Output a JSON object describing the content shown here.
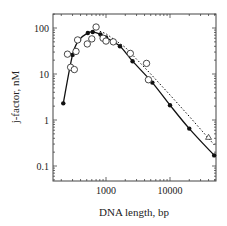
{
  "chart_data": {
    "type": "scatter",
    "title": "",
    "xlabel": "DNA length, bp",
    "ylabel": "j-factor, nM",
    "xscale": "log",
    "yscale": "log",
    "xlim": [
      150,
      55000
    ],
    "ylim": [
      0.05,
      200
    ],
    "x_ticks": [
      {
        "value": 1000,
        "label": "1000"
      },
      {
        "value": 10000,
        "label": "10000"
      }
    ],
    "y_ticks": [
      {
        "value": 100,
        "label": "100"
      },
      {
        "value": 10,
        "label": "10"
      },
      {
        "value": 1,
        "label": "1"
      },
      {
        "value": 0.1,
        "label": "0.1"
      }
    ],
    "grid": false,
    "legend": null,
    "series": [
      {
        "name": "filled circles (solid fit line)",
        "marker": "filled-circle",
        "line": "solid",
        "points": [
          [
            215,
            2.3
          ],
          [
            300,
            26
          ],
          [
            380,
            55
          ],
          [
            520,
            78
          ],
          [
            620,
            82
          ],
          [
            820,
            72
          ],
          [
            1000,
            62
          ],
          [
            1650,
            40
          ],
          [
            2600,
            19
          ],
          [
            5300,
            6.5
          ],
          [
            10000,
            2.1
          ],
          [
            20000,
            0.65
          ],
          [
            49000,
            0.17
          ]
        ]
      },
      {
        "name": "open circles",
        "marker": "open-circle",
        "line": "none",
        "points": [
          [
            250,
            27
          ],
          [
            280,
            14
          ],
          [
            320,
            12.5
          ],
          [
            340,
            31
          ],
          [
            360,
            55
          ],
          [
            510,
            45
          ],
          [
            600,
            58
          ],
          [
            700,
            105
          ],
          [
            900,
            60
          ],
          [
            1000,
            52
          ],
          [
            1300,
            50
          ],
          [
            2400,
            28
          ],
          [
            4300,
            17
          ],
          [
            4600,
            7.5
          ]
        ]
      },
      {
        "name": "dotted theoretical line",
        "marker": "none",
        "line": "dotted",
        "points": [
          [
            800,
            85
          ],
          [
            1000,
            75
          ],
          [
            2000,
            38
          ],
          [
            5000,
            10
          ],
          [
            10000,
            3.5
          ],
          [
            20000,
            1.2
          ],
          [
            50000,
            0.28
          ]
        ]
      },
      {
        "name": "open triangle",
        "marker": "open-triangle",
        "line": "none",
        "points": [
          [
            40000,
            0.42
          ]
        ]
      }
    ]
  }
}
